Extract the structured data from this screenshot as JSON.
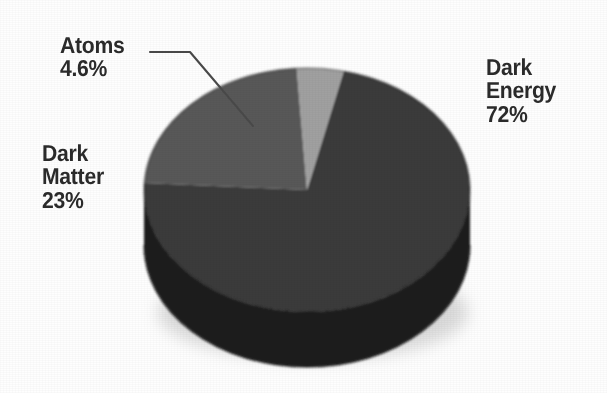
{
  "chart_data": {
    "type": "pie",
    "title": "",
    "subtitle": "",
    "xlabel": "",
    "ylabel": "",
    "legend_position": "none",
    "grid": false,
    "three_d": true,
    "categories": [
      "Dark Energy",
      "Dark Matter",
      "Atoms"
    ],
    "values": [
      72,
      23,
      4.6
    ],
    "value_labels": [
      "72%",
      "23%",
      "4.6%"
    ],
    "slice_colors": [
      "#3a3a3a",
      "#585858",
      "#a0a0a0"
    ],
    "slices": [
      {
        "name": "Dark Energy",
        "label_line1": "Dark",
        "label_line2": "Energy",
        "label_line3": "72%",
        "value": 72,
        "value_text": "72%",
        "color": "#3a3a3a",
        "side_color": "#1e1e1e"
      },
      {
        "name": "Dark Matter",
        "label_line1": "Dark",
        "label_line2": "Matter",
        "label_line3": "23%",
        "value": 23,
        "value_text": "23%",
        "color": "#585858",
        "side_color": "#303030"
      },
      {
        "name": "Atoms",
        "label_line1": "Atoms",
        "label_line2": "4.6%",
        "label_line3": "",
        "value": 4.6,
        "value_text": "4.6%",
        "color": "#a0a0a0",
        "side_color": "#6a6a6a"
      }
    ],
    "annotations": [
      {
        "name": "atoms-leader-line",
        "from": "Atoms label",
        "to": "Atoms slice"
      }
    ],
    "background_color": "#fefefe",
    "text_color": "#2b2b2b"
  },
  "labels": {
    "atoms": {
      "line1": "Atoms",
      "line2": "4.6%"
    },
    "dark_matter": {
      "line1": "Dark",
      "line2": "Matter",
      "line3": "23%"
    },
    "dark_energy": {
      "line1": "Dark",
      "line2": "Energy",
      "line3": "72%"
    }
  }
}
